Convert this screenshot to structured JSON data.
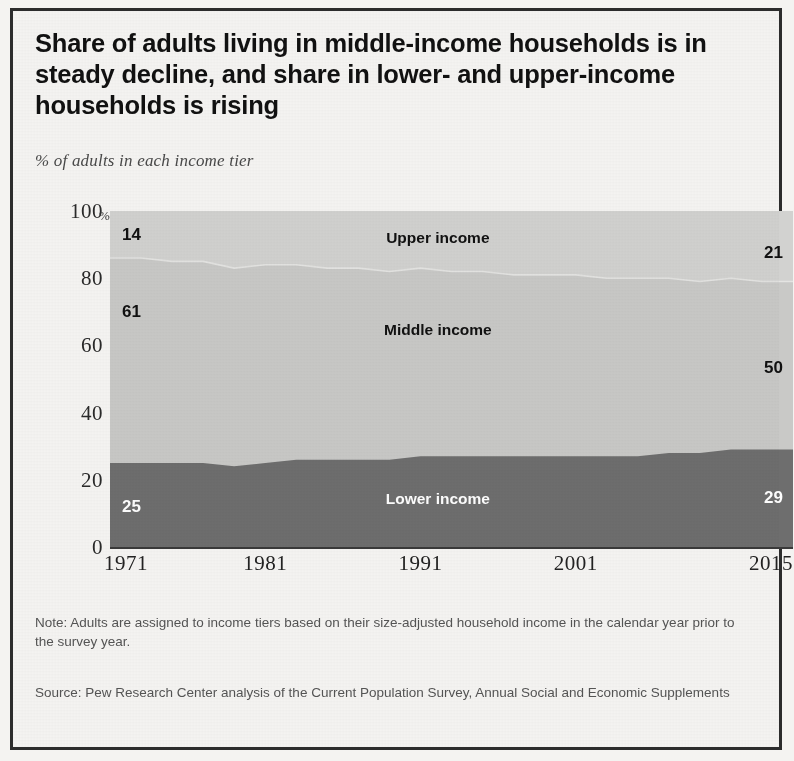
{
  "title": "Share of adults living in middle-income households is in steady decline, and share in lower- and upper-income households is rising",
  "subtitle": "% of adults in each income tier",
  "note": "Note: Adults are assigned to income tiers based on their size-adjusted household income in the calendar year prior to the survey year.",
  "source": "Source: Pew Research Center analysis of the Current Population Survey, Annual Social and Economic Supplements",
  "axis": {
    "y_unit": "%",
    "y_ticks": [
      "100",
      "80",
      "60",
      "40",
      "20",
      "0"
    ],
    "x_ticks": [
      "1971",
      "1981",
      "1991",
      "2001",
      "2015"
    ]
  },
  "labels": {
    "upper_series": "Upper income",
    "middle_series": "Middle income",
    "lower_series": "Lower income",
    "upper_start": "14",
    "upper_end": "21",
    "middle_start": "61",
    "middle_end": "50",
    "lower_start": "25",
    "lower_end": "29"
  },
  "colors": {
    "lower": "#6e6e6e",
    "middle": "#c9c9c7",
    "upper": "#d2d2d0",
    "border": "#2c2c2c",
    "axis": "#3a3a3a"
  },
  "chart_data": {
    "type": "area",
    "stacked": true,
    "title": "Share of adults living in middle-income households is in steady decline, and share in lower- and upper-income households is rising",
    "subtitle": "% of adults in each income tier",
    "xlabel": "",
    "ylabel": "% of adults in each income tier",
    "ylim": [
      0,
      100
    ],
    "xlim": [
      1971,
      2015
    ],
    "grid": false,
    "legend": "inline-annotations",
    "x": [
      1971,
      1973,
      1975,
      1977,
      1979,
      1981,
      1983,
      1985,
      1987,
      1989,
      1991,
      1993,
      1995,
      1997,
      1999,
      2001,
      2003,
      2005,
      2007,
      2009,
      2011,
      2013,
      2015
    ],
    "series": [
      {
        "name": "Lower income",
        "color": "#6e6e6e",
        "values": [
          25,
          25,
          25,
          25,
          24,
          25,
          26,
          26,
          26,
          26,
          27,
          27,
          27,
          27,
          27,
          27,
          27,
          27,
          28,
          28,
          29,
          29,
          29
        ]
      },
      {
        "name": "Middle income",
        "color": "#c9c9c7",
        "values": [
          61,
          61,
          60,
          60,
          59,
          59,
          58,
          57,
          57,
          56,
          56,
          55,
          55,
          54,
          54,
          54,
          53,
          53,
          52,
          51,
          51,
          50,
          50
        ]
      },
      {
        "name": "Upper income",
        "color": "#d2d2d0",
        "values": [
          14,
          14,
          15,
          15,
          17,
          16,
          16,
          17,
          17,
          18,
          17,
          18,
          18,
          19,
          19,
          19,
          20,
          20,
          20,
          21,
          20,
          21,
          21
        ]
      }
    ],
    "annotations": [
      {
        "text": "14",
        "series": "Upper income",
        "position": "left-start"
      },
      {
        "text": "21",
        "series": "Upper income",
        "position": "right-end"
      },
      {
        "text": "61",
        "series": "Middle income",
        "position": "left-start"
      },
      {
        "text": "50",
        "series": "Middle income",
        "position": "right-end"
      },
      {
        "text": "25",
        "series": "Lower income",
        "position": "left-start"
      },
      {
        "text": "29",
        "series": "Lower income",
        "position": "right-end"
      },
      {
        "text": "Upper income",
        "series": "Upper income",
        "position": "center"
      },
      {
        "text": "Middle income",
        "series": "Middle income",
        "position": "center"
      },
      {
        "text": "Lower income",
        "series": "Lower income",
        "position": "center"
      }
    ]
  }
}
